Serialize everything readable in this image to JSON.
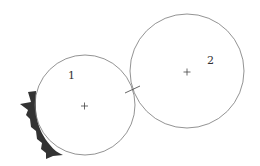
{
  "diagram": {
    "circles": [
      {
        "id": "1",
        "label": "1",
        "cx": 85,
        "cy": 105,
        "r": 50,
        "label_x": 69,
        "label_y": 80
      },
      {
        "id": "2",
        "label": "2",
        "cx": 187,
        "cy": 71,
        "r": 57,
        "label_x": 207,
        "label_y": 64
      }
    ],
    "center_marker": "+",
    "contact_tick": {
      "x1": 125,
      "y1": 93,
      "x2": 140,
      "y2": 86
    },
    "contact_point": {
      "x": 133,
      "y": 90
    },
    "wear_region": {
      "color": "#333333",
      "attached_to": "1"
    },
    "stroke_color": "#777777"
  }
}
